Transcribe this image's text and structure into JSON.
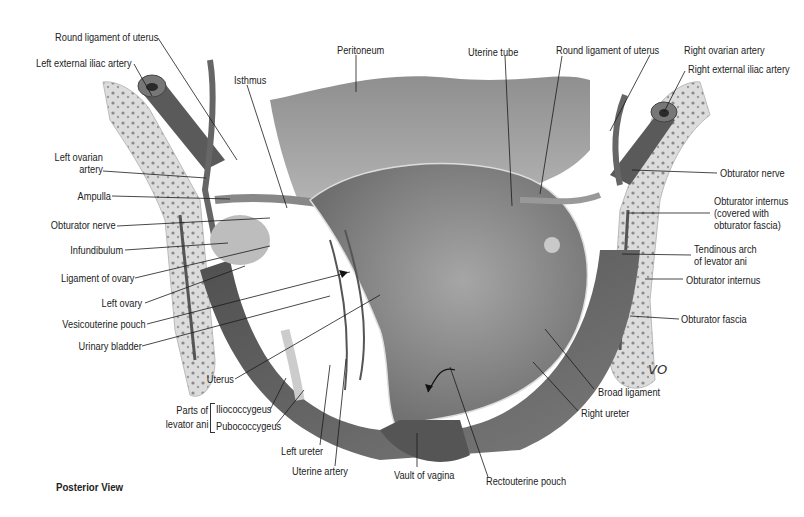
{
  "figure": {
    "view_caption": "Posterior View",
    "artist_signature": "VO",
    "colors": {
      "background": "#ffffff",
      "label_text": "#222222",
      "leader_line": "#1a1a1a",
      "peritoneum": "#a9a9a9",
      "uterus": "#8c8c8c",
      "bone": "#d8d8d8",
      "muscle": "#5e5e5e",
      "vessel": "#6a6a6a"
    },
    "labels_left": [
      {
        "id": "round-ligament-left",
        "text": "Round ligament of uterus"
      },
      {
        "id": "left-external-iliac-artery",
        "text": "Left external iliac artery"
      },
      {
        "id": "isthmus",
        "text": "Isthmus"
      },
      {
        "id": "left-ovarian-artery-1",
        "text": "Left ovarian"
      },
      {
        "id": "left-ovarian-artery-2",
        "text": "artery"
      },
      {
        "id": "ampulla",
        "text": "Ampulla"
      },
      {
        "id": "obturator-nerve-left",
        "text": "Obturator nerve"
      },
      {
        "id": "infundibulum",
        "text": "Infundibulum"
      },
      {
        "id": "ligament-of-ovary",
        "text": "Ligament of ovary"
      },
      {
        "id": "left-ovary",
        "text": "Left ovary"
      },
      {
        "id": "vesicouterine-pouch",
        "text": "Vesicouterine pouch"
      },
      {
        "id": "urinary-bladder",
        "text": "Urinary bladder"
      },
      {
        "id": "uterus",
        "text": "Uterus"
      }
    ],
    "levator_ani_group": {
      "group_label_line1": "Parts of",
      "group_label_line2": "levator ani",
      "parts": [
        "Iliococcygeus",
        "Pubococcygeus"
      ]
    },
    "labels_bottom": [
      {
        "id": "left-ureter",
        "text": "Left ureter"
      },
      {
        "id": "uterine-artery",
        "text": "Uterine artery"
      },
      {
        "id": "vault-of-vagina",
        "text": "Vault of vagina"
      },
      {
        "id": "rectouterine-pouch",
        "text": "Rectouterine pouch"
      },
      {
        "id": "right-ureter",
        "text": "Right ureter"
      },
      {
        "id": "broad-ligament",
        "text": "Broad ligament"
      }
    ],
    "labels_top": [
      {
        "id": "peritoneum",
        "text": "Peritoneum"
      },
      {
        "id": "uterine-tube",
        "text": "Uterine tube"
      },
      {
        "id": "round-ligament-right",
        "text": "Round ligament of uterus"
      },
      {
        "id": "right-ovarian-artery",
        "text": "Right ovarian artery"
      },
      {
        "id": "right-external-iliac-artery",
        "text": "Right external iliac artery"
      }
    ],
    "labels_right": [
      {
        "id": "obturator-nerve-right",
        "text": "Obturator nerve"
      },
      {
        "id": "obturator-internus-covered-1",
        "text": "Obturator internus"
      },
      {
        "id": "obturator-internus-covered-2",
        "text": "(covered with"
      },
      {
        "id": "obturator-internus-covered-3",
        "text": "obturator fascia)"
      },
      {
        "id": "tendinous-arch-1",
        "text": "Tendinous arch"
      },
      {
        "id": "tendinous-arch-2",
        "text": "of levator ani"
      },
      {
        "id": "obturator-internus",
        "text": "Obturator internus"
      },
      {
        "id": "obturator-fascia",
        "text": "Obturator fascia"
      }
    ]
  }
}
